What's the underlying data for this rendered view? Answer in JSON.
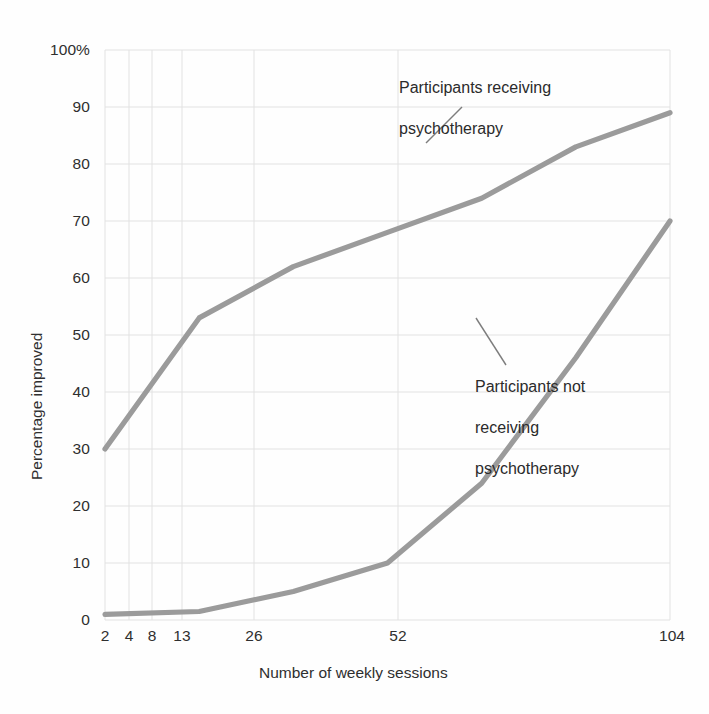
{
  "chart_data": {
    "type": "line",
    "title": "",
    "xlabel": "Number of weekly sessions",
    "ylabel": "Percentage improved",
    "x_tick_labels": [
      "2",
      "4",
      "8",
      "13",
      "26",
      "52",
      "104"
    ],
    "x_tick_values": [
      2,
      4,
      8,
      13,
      26,
      52,
      104
    ],
    "x_scale": "log-like (ordinal session counts)",
    "y_tick_labels": [
      "0",
      "10",
      "20",
      "30",
      "40",
      "50",
      "60",
      "70",
      "80",
      "90",
      "100%"
    ],
    "y_tick_values": [
      0,
      10,
      20,
      30,
      40,
      50,
      60,
      70,
      80,
      90,
      100
    ],
    "ylim": [
      0,
      100
    ],
    "grid": true,
    "legend": "none (inline annotations)",
    "line_color": "#9b9b9b",
    "grid_color": "#e2e2e2",
    "series": [
      {
        "name": "Participants receiving psychotherapy",
        "x": [
          2,
          4,
          8,
          13,
          26,
          52,
          104
        ],
        "values": [
          30,
          53,
          62,
          68,
          74,
          83,
          89
        ]
      },
      {
        "name": "Participants not receiving psychotherapy",
        "x": [
          2,
          4,
          8,
          13,
          26,
          52,
          104
        ],
        "values": [
          1,
          1.5,
          5,
          10,
          24,
          46,
          70
        ]
      }
    ],
    "annotations": [
      {
        "id": "upper",
        "text": "Participants receiving\npsychotherapy",
        "points_to_series": "Participants receiving psychotherapy"
      },
      {
        "id": "lower",
        "text": "Participants not\nreceiving\npsychotherapy",
        "points_to_series": "Participants not receiving psychotherapy"
      }
    ]
  },
  "axes": {
    "y_labels": [
      "100%",
      "90",
      "80",
      "70",
      "60",
      "50",
      "40",
      "30",
      "20",
      "10",
      "0"
    ],
    "x_labels": [
      "2",
      "4",
      "8",
      "13",
      "26",
      "52",
      "104"
    ],
    "y_title": "Percentage improved",
    "x_title": "Number of weekly sessions"
  },
  "annotations": {
    "upper_line1": "Participants receiving",
    "upper_line2": "psychotherapy",
    "lower_line1": "Participants not",
    "lower_line2": "receiving",
    "lower_line3": "psychotherapy"
  }
}
